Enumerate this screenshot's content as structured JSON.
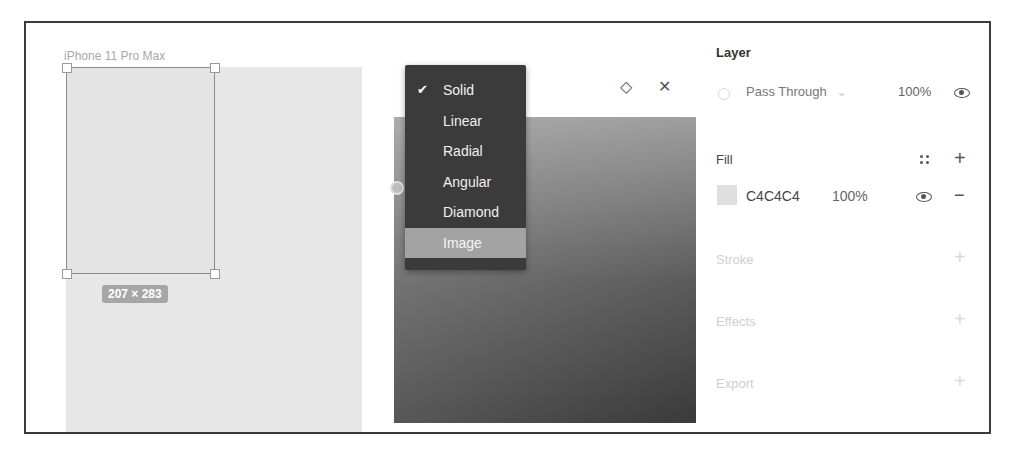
{
  "canvas": {
    "frame_label": "iPhone 11 Pro Max",
    "selection_size": "207 × 283",
    "artboard_color": "#e7e7e7"
  },
  "color_picker": {
    "header_icons": [
      "style-icon",
      "close-icon"
    ],
    "style_glyph": "◇",
    "close_glyph": "✕",
    "fill_type_menu": {
      "items": [
        {
          "label": "Solid",
          "checked": true
        },
        {
          "label": "Linear",
          "checked": false
        },
        {
          "label": "Radial",
          "checked": false
        },
        {
          "label": "Angular",
          "checked": false
        },
        {
          "label": "Diamond",
          "checked": false
        },
        {
          "label": "Image",
          "checked": false,
          "highlighted": true
        }
      ],
      "check_glyph": "✔"
    }
  },
  "properties": {
    "layer": {
      "title": "Layer",
      "blend_mode": "Pass Through",
      "blend_caret": "⌄",
      "opacity": "100%"
    },
    "fill": {
      "title": "Fill",
      "hex": "C4C4C4",
      "opacity": "100%",
      "swatch_color": "#c4c4c4",
      "add_glyph": "+",
      "remove_glyph": "−"
    },
    "stroke": {
      "title": "Stroke",
      "add_glyph": "+"
    },
    "effects": {
      "title": "Effects",
      "add_glyph": "+"
    },
    "export": {
      "title": "Export",
      "add_glyph": "+"
    }
  }
}
